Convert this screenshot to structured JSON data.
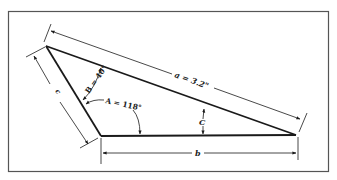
{
  "diagram": {
    "type": "triangle-with-dimensions",
    "colors": {
      "line": "#1a1a1a",
      "frame": "#555555",
      "background": "#ffffff"
    },
    "vertices": {
      "top_left": {
        "x": 46,
        "y": 46
      },
      "bottom_left": {
        "x": 101,
        "y": 136
      },
      "bottom_right": {
        "x": 296,
        "y": 135
      }
    },
    "labels": {
      "side_a": "a = 3.2\"",
      "side_b": "b",
      "side_c": "c",
      "angle_A": "A = 118°",
      "angle_B": "B = 40°",
      "angle_C": "C"
    }
  }
}
